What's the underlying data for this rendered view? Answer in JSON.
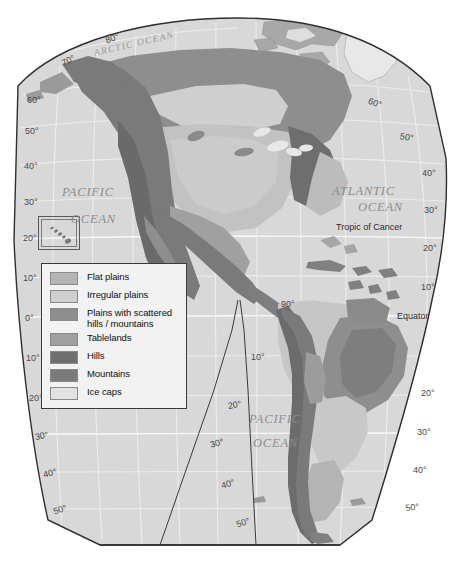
{
  "figure": {
    "name": "physical-landform-map-americas",
    "background_color": "#ffffff"
  },
  "legend": {
    "name": "map-legend",
    "border_color": "#3a3a3a",
    "background_color": "#f2f2f2",
    "items": [
      {
        "label": "Flat plains",
        "color": "#b4b4b4"
      },
      {
        "label": "Irregular plains",
        "color": "#cfcfcf"
      },
      {
        "label": "Plains with scattered\nhills / mountains",
        "color": "#8e8e8e"
      },
      {
        "label": "Tablelands",
        "color": "#a0a0a0"
      },
      {
        "label": "Hills",
        "color": "#6e6e6e"
      },
      {
        "label": "Mountains",
        "color": "#7a7a7a"
      },
      {
        "label": "Ice caps",
        "color": "#e2e2e2"
      }
    ]
  },
  "ocean_labels": [
    {
      "text": "ARCTIC  OCEAN",
      "x": 93,
      "y": 48,
      "size": "sm",
      "rotate": -13
    },
    {
      "text": "PACIFIC",
      "x": 62,
      "y": 185,
      "size": "lg",
      "rotate": 0
    },
    {
      "text": "OCEAN",
      "x": 71,
      "y": 212,
      "size": "lg",
      "rotate": 0
    },
    {
      "text": "ATLANTIC",
      "x": 332,
      "y": 184,
      "size": "lg",
      "rotate": 0
    },
    {
      "text": "OCEAN",
      "x": 358,
      "y": 200,
      "size": "lg",
      "rotate": 0
    },
    {
      "text": "PACIFIC",
      "x": 249,
      "y": 412,
      "size": "lg",
      "rotate": 0
    },
    {
      "text": "OCEAN",
      "x": 253,
      "y": 436,
      "size": "lg",
      "rotate": 0
    }
  ],
  "line_labels": [
    {
      "text": "Tropic of Cancer",
      "x": 336,
      "y": 222
    },
    {
      "text": "Equator",
      "x": 397,
      "y": 311
    }
  ],
  "graticule_labels": [
    {
      "text": "80°",
      "x": 104,
      "y": 36,
      "rotate": -20
    },
    {
      "text": "70°",
      "x": 60,
      "y": 59,
      "rotate": -26
    },
    {
      "text": "60°",
      "x": 27,
      "y": 95,
      "rotate": 0
    },
    {
      "text": "50°",
      "x": 25,
      "y": 126,
      "rotate": 0
    },
    {
      "text": "40°",
      "x": 24,
      "y": 161,
      "rotate": 0
    },
    {
      "text": "30°",
      "x": 24,
      "y": 197,
      "rotate": 0
    },
    {
      "text": "20°",
      "x": 23,
      "y": 233,
      "rotate": 0
    },
    {
      "text": "10°",
      "x": 23,
      "y": 273,
      "rotate": 0
    },
    {
      "text": "0°",
      "x": 25,
      "y": 313,
      "rotate": 0
    },
    {
      "text": "10°",
      "x": 26,
      "y": 353,
      "rotate": 0
    },
    {
      "text": "20°",
      "x": 29,
      "y": 393,
      "rotate": 0
    },
    {
      "text": "30°",
      "x": 34,
      "y": 432,
      "rotate": -10
    },
    {
      "text": "40°",
      "x": 42,
      "y": 470,
      "rotate": -14
    },
    {
      "text": "50°",
      "x": 52,
      "y": 507,
      "rotate": -18
    },
    {
      "text": "60°",
      "x": 370,
      "y": 96,
      "rotate": 18
    },
    {
      "text": "50°",
      "x": 401,
      "y": 131,
      "rotate": 10
    },
    {
      "text": "40°",
      "x": 422,
      "y": 168,
      "rotate": 0
    },
    {
      "text": "30°",
      "x": 424,
      "y": 205,
      "rotate": 0
    },
    {
      "text": "20°",
      "x": 423,
      "y": 243,
      "rotate": 0
    },
    {
      "text": "10°",
      "x": 421,
      "y": 282,
      "rotate": 0
    },
    {
      "text": "20°",
      "x": 421,
      "y": 388,
      "rotate": 0
    },
    {
      "text": "30°",
      "x": 417,
      "y": 427,
      "rotate": 0
    },
    {
      "text": "40°",
      "x": 413,
      "y": 465,
      "rotate": 0
    },
    {
      "text": "50°",
      "x": 405,
      "y": 503,
      "rotate": -6
    },
    {
      "text": "90°",
      "x": 281,
      "y": 299,
      "rotate": 0
    },
    {
      "text": "10°",
      "x": 251,
      "y": 352,
      "rotate": 0
    },
    {
      "text": "20°",
      "x": 227,
      "y": 401,
      "rotate": -10
    },
    {
      "text": "30°",
      "x": 209,
      "y": 440,
      "rotate": -14
    },
    {
      "text": "40°",
      "x": 220,
      "y": 481,
      "rotate": -16
    },
    {
      "text": "50°",
      "x": 235,
      "y": 520,
      "rotate": -18
    }
  ],
  "inset": {
    "name": "hawaii-inset",
    "label": ""
  },
  "palette": {
    "ocean": "#d8d8d8",
    "ocean_dark": "#cfcfcf",
    "flat_plains": "#b4b4b4",
    "irregular_plains": "#cfcfcf",
    "plains_scattered": "#8e8e8e",
    "tablelands": "#a0a0a0",
    "hills": "#6e6e6e",
    "mountains": "#7a7a7a",
    "ice_caps": "#e8e8e8",
    "graticule": "#f0f0f0",
    "outline": "#3a3a3a"
  }
}
